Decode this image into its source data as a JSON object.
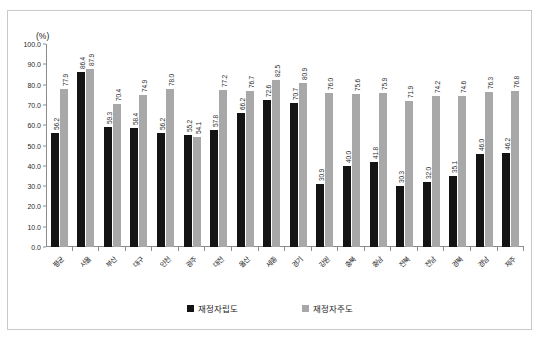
{
  "figure": {
    "unit_label": "(%)",
    "frame_border_color": "#c9c9c9",
    "axis_color": "#8c8c8c"
  },
  "chart_data": {
    "type": "bar",
    "title": "",
    "xlabel": "",
    "ylabel": "(%)",
    "ylim": [
      0.0,
      100.0
    ],
    "ytick_step": 10.0,
    "grid": false,
    "legend_position": "bottom-center",
    "categories": [
      "평균",
      "서울",
      "부산",
      "대구",
      "인천",
      "광주",
      "대전",
      "울산",
      "세종",
      "경기",
      "강원",
      "충북",
      "충남",
      "전북",
      "전남",
      "경북",
      "경남",
      "제주"
    ],
    "ytick_labels": [
      "100.0",
      "90.0",
      "80.0",
      "70.0",
      "60.0",
      "50.0",
      "40.0",
      "30.0",
      "20.0",
      "10.0",
      "0.0"
    ],
    "ytick_values": [
      100.0,
      90.0,
      80.0,
      70.0,
      60.0,
      50.0,
      40.0,
      30.0,
      20.0,
      10.0,
      0.0
    ],
    "series": [
      {
        "name": "재정자립도",
        "color": "#141414",
        "values": [
          56.2,
          86.4,
          59.3,
          58.4,
          56.2,
          55.2,
          57.8,
          66.2,
          72.6,
          70.7,
          30.9,
          40.0,
          41.8,
          30.3,
          32.0,
          35.1,
          46.0,
          46.2
        ],
        "labels": [
          "56.2",
          "86.4",
          "59.3",
          "58.4",
          "56.2",
          "55.2",
          "57.8",
          "66.2",
          "72.6",
          "70.7",
          "30.9",
          "40.0",
          "41.8",
          "30.3",
          "32.0",
          "35.1",
          "46.0",
          "46.2"
        ]
      },
      {
        "name": "재정자주도",
        "color": "#a8a8a8",
        "values": [
          77.9,
          87.9,
          70.4,
          74.9,
          78.0,
          54.1,
          77.2,
          76.7,
          82.5,
          80.9,
          76.0,
          75.6,
          75.9,
          71.9,
          74.2,
          74.6,
          76.3,
          76.8
        ],
        "labels": [
          "77.9",
          "87.9",
          "70.4",
          "74.9",
          "78.0",
          "54.1",
          "77.2",
          "76.7",
          "82.5",
          "80.9",
          "76.0",
          "75.6",
          "75.9",
          "71.9",
          "74.2",
          "74.6",
          "76.3",
          "76.8"
        ]
      }
    ]
  }
}
